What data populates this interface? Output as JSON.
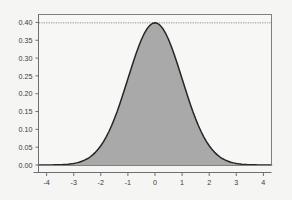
{
  "chart_data": {
    "type": "line",
    "title": "",
    "subtitle": "",
    "xlabel": "",
    "ylabel": "",
    "xlim": [
      -4.3,
      4.3
    ],
    "ylim": [
      0.0,
      0.4223
    ],
    "grid": false,
    "legend": null,
    "series": [
      {
        "name": "standard normal density",
        "type": "area",
        "fill_color": "#a9a9a9",
        "line_color": "#262626",
        "formula": "phi(x) = (1/sqrt(2*pi)) * exp(-x^2/2)",
        "x": [
          -4.3,
          -4.2,
          -4.1,
          -4,
          -3.9,
          -3.8,
          -3.7,
          -3.6,
          -3.5,
          -3.4,
          -3.3,
          -3.2,
          -3.1,
          -3,
          -2.9,
          -2.8,
          -2.7,
          -2.6,
          -2.5,
          -2.4,
          -2.3,
          -2.2,
          -2.1,
          -2,
          -1.9,
          -1.8,
          -1.7,
          -1.6,
          -1.5,
          -1.4,
          -1.3,
          -1.2,
          -1.1,
          -1,
          -0.9,
          -0.8,
          -0.7,
          -0.6,
          -0.5,
          -0.4,
          -0.3,
          -0.2,
          -0.1,
          0,
          0.1,
          0.2,
          0.3,
          0.4,
          0.5,
          0.6,
          0.7,
          0.8,
          0.9,
          1,
          1.1,
          1.2,
          1.3,
          1.4,
          1.5,
          1.6,
          1.7,
          1.8,
          1.9,
          2,
          2.1,
          2.2,
          2.3,
          2.4,
          2.5,
          2.6,
          2.7,
          2.8,
          2.9,
          3,
          3.1,
          3.2,
          3.3,
          3.4,
          3.5,
          3.6,
          3.7,
          3.8,
          3.9,
          4,
          4.1,
          4.2,
          4.3
        ],
        "y": [
          0.0,
          0.0001,
          0.0001,
          0.0001,
          0.0002,
          0.0003,
          0.0004,
          0.0006,
          0.0009,
          0.0012,
          0.0017,
          0.0024,
          0.0033,
          0.0044,
          0.006,
          0.0079,
          0.0104,
          0.0136,
          0.0175,
          0.0224,
          0.0283,
          0.0355,
          0.044,
          0.054,
          0.0656,
          0.079,
          0.094,
          0.1109,
          0.1295,
          0.1497,
          0.1714,
          0.1942,
          0.2179,
          0.242,
          0.2661,
          0.2897,
          0.3123,
          0.3332,
          0.3521,
          0.3683,
          0.3814,
          0.391,
          0.397,
          0.3989,
          0.397,
          0.391,
          0.3814,
          0.3683,
          0.3521,
          0.3332,
          0.3123,
          0.2897,
          0.2661,
          0.242,
          0.2179,
          0.1942,
          0.1714,
          0.1497,
          0.1295,
          0.1109,
          0.094,
          0.079,
          0.0656,
          0.054,
          0.044,
          0.0355,
          0.0283,
          0.0224,
          0.0175,
          0.0136,
          0.0104,
          0.0079,
          0.006,
          0.0044,
          0.0033,
          0.0024,
          0.0017,
          0.0012,
          0.0009,
          0.0006,
          0.0004,
          0.0003,
          0.0002,
          0.0001,
          0.0001,
          0.0001,
          0.0
        ]
      }
    ],
    "reference_lines": [
      {
        "name": "peak-reference-line",
        "orientation": "horizontal",
        "value": 0.3989,
        "style": "dotted",
        "color": "#8c8c8c",
        "label": ""
      }
    ],
    "x_ticks": [
      {
        "value": -4,
        "label": "-4"
      },
      {
        "value": -3,
        "label": "-3"
      },
      {
        "value": -2,
        "label": "-2"
      },
      {
        "value": -1,
        "label": "-1"
      },
      {
        "value": 0,
        "label": "0"
      },
      {
        "value": 1,
        "label": "1"
      },
      {
        "value": 2,
        "label": "2"
      },
      {
        "value": 3,
        "label": "3"
      },
      {
        "value": 4,
        "label": "4"
      }
    ],
    "y_ticks": [
      {
        "value": 0.0,
        "label": "0.00"
      },
      {
        "value": 0.05,
        "label": "0.05"
      },
      {
        "value": 0.1,
        "label": "0.10"
      },
      {
        "value": 0.15,
        "label": "0.15"
      },
      {
        "value": 0.2,
        "label": "0.20"
      },
      {
        "value": 0.25,
        "label": "0.25"
      },
      {
        "value": 0.3,
        "label": "0.30"
      },
      {
        "value": 0.35,
        "label": "0.35"
      },
      {
        "value": 0.4,
        "label": "0.40"
      }
    ],
    "colors": {
      "figure_background": "#f5f5f3",
      "plot_background": "#f7f7f5",
      "plot_border": "#808080",
      "axis": "#6e6e6e",
      "tick_text": "#3b3b3b",
      "curve_line": "#262626",
      "curve_fill": "#a9a9a9",
      "reference_line": "#8c8c8c"
    }
  }
}
